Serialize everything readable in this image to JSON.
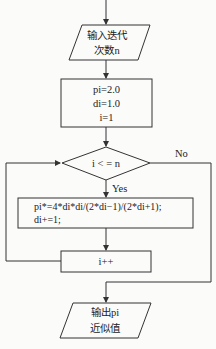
{
  "flowchart": {
    "input_node": {
      "line1": "输入迭代",
      "line2": "次数n"
    },
    "init_node": {
      "line1": "pi=2.0",
      "line2": "di=1.0",
      "line3": "i=1"
    },
    "condition_node": {
      "label": "i < = n",
      "yes_label": "Yes",
      "no_label": "No"
    },
    "body_node": {
      "line1": "pi*=4*di*di/(2*di−1)/(2*di+1);",
      "line2": "di+=1;"
    },
    "increment_node": {
      "label": "i++"
    },
    "output_node": {
      "line1": "输出pi",
      "line2": "近似值"
    }
  },
  "colors": {
    "stroke": "#333333",
    "background": "#fbfbfa",
    "text": "#222222"
  }
}
